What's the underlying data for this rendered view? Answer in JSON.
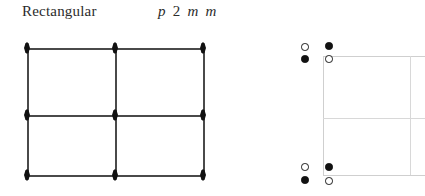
{
  "header": {
    "lattice_label": "Rectangular",
    "group_symbol_parts": [
      "p",
      "2",
      "m",
      "m"
    ],
    "group_symbol_full": "p 2 m m"
  },
  "colors": {
    "symmetry_line": "#4a4a4a",
    "rotation_point": "#111111",
    "cell_edge": "#cfcfcf",
    "cell_mid": "#d8d8d8",
    "position_filled": "#111111",
    "position_open_fill": "#ffffff",
    "position_open_stroke": "#1a1a1a",
    "text": "#2b2b2b",
    "background": "#ffffff"
  },
  "diagram_data": {
    "type": "plane-group-symmetry-diagram",
    "plane_group": "p 2 m m",
    "lattice_type": "Rectangular",
    "panels": [
      {
        "name": "symmetry-elements",
        "description": "Mirror lines drawn as solid lines forming a 2x2 array of rectangles with two-fold rotation points at every intersection",
        "cell_box": {
          "x0": 27,
          "y0": 48,
          "x1": 203,
          "y1": 175
        },
        "horizontal_lines_y": [
          48,
          115,
          175
        ],
        "vertical_lines_x": [
          27,
          115,
          203
        ],
        "rotation_points": [
          {
            "x": 27,
            "y": 48,
            "order": 2
          },
          {
            "x": 115,
            "y": 48,
            "order": 2
          },
          {
            "x": 203,
            "y": 48,
            "order": 2
          },
          {
            "x": 27,
            "y": 115,
            "order": 2
          },
          {
            "x": 115,
            "y": 115,
            "order": 2
          },
          {
            "x": 203,
            "y": 115,
            "order": 2
          },
          {
            "x": 27,
            "y": 175,
            "order": 2
          },
          {
            "x": 115,
            "y": 175,
            "order": 2
          },
          {
            "x": 203,
            "y": 175,
            "order": 2
          }
        ]
      },
      {
        "name": "general-positions",
        "description": "General equivalent positions shown as filled and open circles clustered around the cell corners",
        "cell_box": {
          "x0": 323,
          "y0": 56,
          "x1": 425,
          "y1": 175
        },
        "horizontal_edges_y": [
          56,
          175
        ],
        "vertical_edges_x": [
          323
        ],
        "mid_lines": {
          "horizontal_y": [
            118
          ],
          "vertical_x": [
            410
          ]
        },
        "positions": [
          {
            "x": 305,
            "y": 47,
            "state": "open"
          },
          {
            "x": 305,
            "y": 59,
            "state": "filled"
          },
          {
            "x": 329,
            "y": 46,
            "state": "filled"
          },
          {
            "x": 329,
            "y": 59,
            "state": "open"
          },
          {
            "x": 305,
            "y": 167,
            "state": "open"
          },
          {
            "x": 305,
            "y": 180,
            "state": "filled"
          },
          {
            "x": 329,
            "y": 167,
            "state": "filled"
          },
          {
            "x": 329,
            "y": 181,
            "state": "open"
          }
        ]
      }
    ]
  }
}
